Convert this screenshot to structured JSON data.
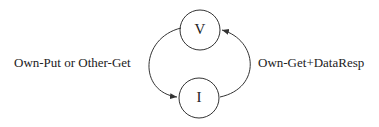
{
  "diagram": {
    "type": "state-machine",
    "nodes": [
      {
        "id": "V",
        "label": "V"
      },
      {
        "id": "I",
        "label": "I"
      }
    ],
    "edges": [
      {
        "from": "V",
        "to": "I",
        "label": "Own-Put or Other-Get"
      },
      {
        "from": "I",
        "to": "V",
        "label": "Own-Get+DataResp"
      }
    ],
    "colors": {
      "stroke": "#333333",
      "text": "#222222",
      "background": "#ffffff"
    }
  }
}
